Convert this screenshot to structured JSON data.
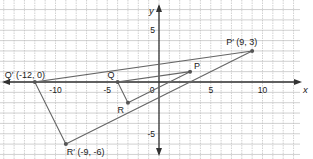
{
  "diagram": {
    "type": "coordinate-plane-dilation",
    "axes": {
      "x_label": "x",
      "y_label": "y",
      "x_ticks": [
        {
          "value": -10,
          "label": "-10"
        },
        {
          "value": -5,
          "label": "-5"
        },
        {
          "value": 0,
          "label": "0"
        },
        {
          "value": 5,
          "label": "5"
        },
        {
          "value": 10,
          "label": "10"
        }
      ],
      "y_ticks": [
        {
          "value": 5,
          "label": "5"
        },
        {
          "value": -5,
          "label": "-5"
        }
      ],
      "x_range": [
        -15,
        15
      ],
      "y_range": [
        -7,
        7
      ],
      "grid": true
    },
    "preimage": {
      "name": "PQR",
      "points": [
        {
          "name": "P",
          "label": "P",
          "x": 3,
          "y": 1
        },
        {
          "name": "Q",
          "label": "Q",
          "x": -4,
          "y": 0
        },
        {
          "name": "R",
          "label": "R",
          "x": -3,
          "y": -2
        }
      ]
    },
    "image": {
      "name": "P'Q'R'",
      "points": [
        {
          "name": "P'",
          "label": "P′ (9, 3)",
          "x": 9,
          "y": 3
        },
        {
          "name": "Q'",
          "label": "Q′ (-12, 0)",
          "x": -12,
          "y": 0
        },
        {
          "name": "R'",
          "label": "R′ (-9, -6)",
          "x": -9,
          "y": -6
        }
      ]
    },
    "colors": {
      "grid": "#bdbdbd",
      "axis": "#333333",
      "triangle": "#666666",
      "point": "#555555",
      "text": "#222222"
    }
  }
}
